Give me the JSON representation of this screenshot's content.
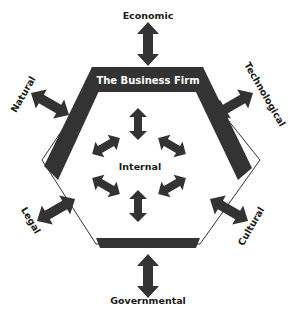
{
  "diagram": {
    "title": "The Business Firm",
    "center_label": "Internal",
    "external_forces": [
      {
        "label": "Economic",
        "position": "top"
      },
      {
        "label": "Technological",
        "position": "upper-right"
      },
      {
        "label": "Cultural",
        "position": "lower-right"
      },
      {
        "label": "Governmental",
        "position": "bottom"
      },
      {
        "label": "Legal",
        "position": "lower-left"
      },
      {
        "label": "Natural",
        "position": "upper-left"
      }
    ],
    "colors": {
      "shape_fill": "#333333",
      "background": "#ffffff",
      "text": "#1a1a1a",
      "title_text": "#ffffff"
    }
  }
}
